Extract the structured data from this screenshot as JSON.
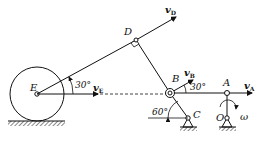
{
  "diagram": {
    "type": "planar-mechanism",
    "points": {
      "E": {
        "label": "E"
      },
      "D": {
        "label": "D"
      },
      "B": {
        "label": "B"
      },
      "A": {
        "label": "A"
      },
      "C": {
        "label": "C"
      },
      "O": {
        "label": "O"
      }
    },
    "velocities": {
      "vE": {
        "symbol": "v",
        "sub": "E"
      },
      "vD": {
        "symbol": "v",
        "sub": "D"
      },
      "vB": {
        "symbol": "v",
        "sub": "B"
      },
      "vA": {
        "symbol": "v",
        "sub": "A"
      }
    },
    "angles": {
      "angle_E": "30°",
      "angle_B": "30°",
      "angle_C": "60°"
    },
    "omega": "ω"
  }
}
